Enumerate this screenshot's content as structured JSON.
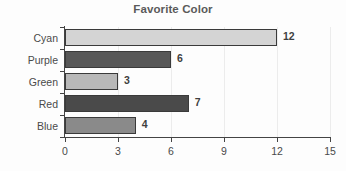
{
  "chart_data": {
    "type": "bar",
    "orientation": "horizontal",
    "title": "Favorite Color",
    "xlabel": "",
    "ylabel": "",
    "categories": [
      "Cyan",
      "Purple",
      "Green",
      "Red",
      "Blue"
    ],
    "values": [
      12,
      6,
      3,
      7,
      4
    ],
    "value_labels": [
      "12",
      "6",
      "3",
      "7",
      "4"
    ],
    "xlim": [
      0,
      15
    ],
    "xticks": [
      0,
      3,
      6,
      9,
      12,
      15
    ],
    "xtick_labels": [
      "0",
      "3",
      "6",
      "9",
      "12",
      "15"
    ],
    "grid": true,
    "grid_axis": "x",
    "legend": false,
    "bar_colors": [
      "#d4d4d4",
      "#585858",
      "#b8b8b8",
      "#4a4a4a",
      "#8a8a8a"
    ],
    "bar_edge_color": "#3a3a3a",
    "title_color": "#5a5a5a",
    "axis_color": "#444444",
    "tick_label_color": "#4a4a4a",
    "grid_color": "#ececec",
    "background_color": "#fdfdfd"
  }
}
